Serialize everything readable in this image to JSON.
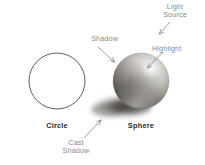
{
  "figure": {
    "background_color": "#ffffff",
    "annotation_color": "#8a8a8a",
    "caption_color": "#2b2b2b",
    "outline_color": "#4a4a4a"
  },
  "annotations": {
    "light_source": "Light\nSource",
    "shadow": "Shadow",
    "highlight": "Highlight",
    "cast_shadow": "Cast\nShadow"
  },
  "captions": {
    "circle": "Circle",
    "sphere": "Sphere"
  },
  "shapes": {
    "circle": {
      "cx": 57,
      "cy": 81,
      "r": 28
    },
    "sphere": {
      "cx": 141,
      "cy": 81,
      "r": 28
    },
    "cast_shadow": {
      "cx": 120,
      "cy": 108,
      "rx": 31,
      "ry": 11
    }
  },
  "arrows": {
    "light_source": {
      "x1": 170,
      "y1": 22,
      "x2": 159,
      "y2": 34
    },
    "shadow": {
      "x1": 98,
      "y1": 47,
      "x2": 115,
      "y2": 62
    },
    "highlight": {
      "x1": 163,
      "y1": 52,
      "x2": 147,
      "y2": 68
    },
    "cast_shadow": {
      "x1": 84,
      "y1": 139,
      "x2": 101,
      "y2": 120
    }
  }
}
